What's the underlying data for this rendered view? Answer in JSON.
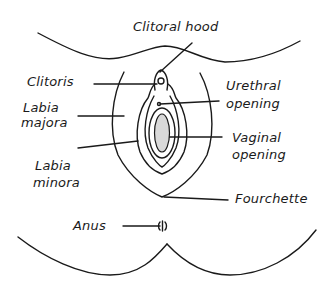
{
  "diagram": {
    "labels": {
      "clitoral_hood": "Clitoral hood",
      "clitoris": "Clitoris",
      "labia_majora_1": "Labia",
      "labia_majora_2": "majora",
      "labia_minora_1": "Labia",
      "labia_minora_2": "minora",
      "urethral_1": "Urethral",
      "urethral_2": "opening",
      "vaginal_1": "Vaginal",
      "vaginal_2": "opening",
      "fourchette": "Fourchette",
      "anus": "Anus"
    },
    "colors": {
      "stroke": "#1a1a1a",
      "vaginal_fill": "#d9d9d9",
      "background": "#ffffff"
    }
  }
}
